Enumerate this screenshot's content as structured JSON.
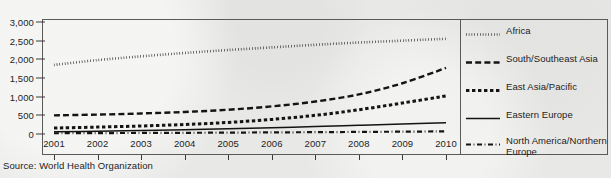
{
  "source_note": "Source: World Health Organization",
  "colors": {
    "background": "#e8e8e6",
    "ink": "#1d1d1d",
    "frame": "#5a5a58",
    "series": "#141414"
  },
  "chart_data": {
    "type": "line",
    "title": "",
    "subtitle": "",
    "xlabel": "",
    "ylabel": "",
    "grid": false,
    "legend_position": "right",
    "xlim": [
      2001,
      2010
    ],
    "ylim": [
      0,
      3000
    ],
    "x": [
      2001,
      2002,
      2003,
      2004,
      2005,
      2006,
      2007,
      2008,
      2009,
      2010
    ],
    "categories": [
      "2001",
      "2002",
      "2003",
      "2004",
      "2005",
      "2006",
      "2007",
      "2008",
      "2009",
      "2010"
    ],
    "xticks": [
      "2001",
      "2002",
      "2003",
      "2004",
      "2005",
      "2006",
      "2007",
      "2008",
      "2009",
      "2010"
    ],
    "yticks": [
      "0",
      "500",
      "1,000",
      "1,500",
      "2,000",
      "2,500",
      "3,000"
    ],
    "ytick_values": [
      0,
      500,
      1000,
      1500,
      2000,
      2500,
      3000
    ],
    "series": [
      {
        "name": "Africa",
        "style": "dotted",
        "values": [
          1850,
          1980,
          2080,
          2170,
          2250,
          2320,
          2390,
          2450,
          2500,
          2550
        ]
      },
      {
        "name": "South/Southeast Asia",
        "style": "dashed",
        "values": [
          500,
          520,
          550,
          590,
          650,
          740,
          870,
          1060,
          1360,
          1770
        ]
      },
      {
        "name": "East Asia/Pacific",
        "style": "thick-dash",
        "values": [
          160,
          185,
          215,
          255,
          310,
          390,
          500,
          650,
          830,
          1020
        ]
      },
      {
        "name": "Eastern Europe",
        "style": "solid",
        "values": [
          60,
          75,
          95,
          115,
          140,
          170,
          200,
          235,
          270,
          300
        ]
      },
      {
        "name": "North America/Northern Europe",
        "style": "dash-dot",
        "values": [
          20,
          24,
          28,
          32,
          37,
          43,
          49,
          56,
          63,
          70
        ]
      }
    ]
  },
  "legend": {
    "items": [
      {
        "label": "Africa",
        "sample": "dotted-line-sample"
      },
      {
        "label": "South/Southeast Asia",
        "sample": "dashed-line-sample"
      },
      {
        "label": "East Asia/Pacific",
        "sample": "thick-dash-line-sample"
      },
      {
        "label": "Eastern Europe",
        "sample": "solid-line-sample"
      },
      {
        "label": "North America/Northern Europe",
        "sample": "dash-dot-line-sample"
      }
    ]
  }
}
